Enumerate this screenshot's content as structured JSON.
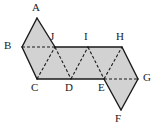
{
  "figure": {
    "type": "geometric-net",
    "canvas": {
      "width": 157,
      "height": 129
    },
    "style": {
      "fill_color": "#d2d2d2",
      "stroke_color": "#1a1a1a",
      "dashed_stroke_color": "#1a1a1a",
      "background_color": "#ffffff",
      "solid_stroke_width": 1.4,
      "dashed_stroke_width": 1.1,
      "dash_pattern": "3,2",
      "label_font_size": 11,
      "label_color": "#1a1a1a"
    },
    "vertices": [
      {
        "id": "A",
        "label": "A",
        "x": 37,
        "y": 18,
        "label_x": 32,
        "label_y": 2
      },
      {
        "id": "B",
        "label": "B",
        "x": 22,
        "y": 47,
        "label_x": 4,
        "label_y": 40
      },
      {
        "id": "C",
        "label": "C",
        "x": 37,
        "y": 79,
        "label_x": 31,
        "label_y": 82
      },
      {
        "id": "D",
        "label": "D",
        "x": 71,
        "y": 79,
        "label_x": 65,
        "label_y": 82
      },
      {
        "id": "E",
        "label": "E",
        "x": 104,
        "y": 79,
        "label_x": 98,
        "label_y": 82
      },
      {
        "id": "F",
        "label": "F",
        "x": 121,
        "y": 110,
        "label_x": 115,
        "label_y": 113
      },
      {
        "id": "G",
        "label": "G",
        "x": 138,
        "y": 79,
        "label_x": 143,
        "label_y": 72
      },
      {
        "id": "H",
        "label": "H",
        "x": 122,
        "y": 47,
        "label_x": 116,
        "label_y": 31
      },
      {
        "id": "I",
        "label": "I",
        "x": 88,
        "y": 47,
        "label_x": 84,
        "label_y": 31
      },
      {
        "id": "J",
        "label": "J",
        "x": 55,
        "y": 47,
        "label_x": 50,
        "label_y": 31
      }
    ],
    "filled_region_outline": "37,18 55,47 122,47 138,79 121,110 104,79 37,79 22,47",
    "solid_edges": [
      {
        "name": "edge-A-B",
        "from": "A",
        "to": "B"
      },
      {
        "name": "edge-A-J",
        "from": "A",
        "to": "J"
      },
      {
        "name": "edge-B-C",
        "from": "B",
        "to": "C"
      },
      {
        "name": "edge-J-I",
        "from": "J",
        "to": "I"
      },
      {
        "name": "edge-I-H",
        "from": "I",
        "to": "H"
      },
      {
        "name": "edge-C-D",
        "from": "C",
        "to": "D"
      },
      {
        "name": "edge-D-E",
        "from": "D",
        "to": "E"
      },
      {
        "name": "edge-H-G",
        "from": "H",
        "to": "G"
      },
      {
        "name": "edge-E-F",
        "from": "E",
        "to": "F"
      },
      {
        "name": "edge-F-G",
        "from": "F",
        "to": "G"
      }
    ],
    "dashed_edges": [
      {
        "name": "edge-B-J",
        "from": "B",
        "to": "J"
      },
      {
        "name": "edge-C-J",
        "from": "C",
        "to": "J"
      },
      {
        "name": "edge-J-D",
        "from": "J",
        "to": "D"
      },
      {
        "name": "edge-D-I",
        "from": "D",
        "to": "I"
      },
      {
        "name": "edge-I-E",
        "from": "I",
        "to": "E"
      },
      {
        "name": "edge-E-H",
        "from": "E",
        "to": "H"
      },
      {
        "name": "edge-E-G",
        "from": "E",
        "to": "G"
      }
    ]
  }
}
